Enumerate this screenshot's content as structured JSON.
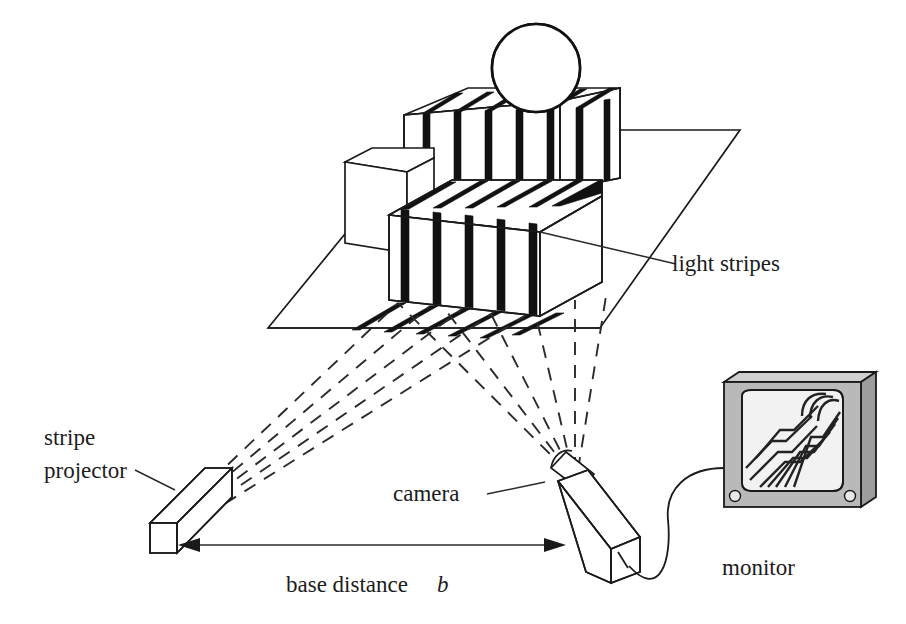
{
  "figure": {
    "background_color": "#ffffff",
    "ink_color": "#1a1a1a"
  },
  "labels": {
    "light_stripes": "light stripes",
    "stripe_projector_line1": "stripe",
    "stripe_projector_line2": "projector",
    "camera": "camera",
    "monitor": "monitor",
    "base_distance_text": "base distance",
    "base_distance_symbol": "b"
  },
  "components": {
    "projector": {
      "name": "stripe projector",
      "shape": "elongated box"
    },
    "camera": {
      "name": "camera",
      "shape": "elongated box with lens"
    },
    "monitor": {
      "name": "monitor",
      "bezel_color": "#b9b9b9",
      "screen_color": "#f2f2f2"
    },
    "scene": {
      "ground_plane": "parallelogram",
      "big_box": "striped box",
      "small_box": "plain box",
      "back_box": "striped back box",
      "sphere": "striped sphere"
    }
  },
  "geometry": {
    "stripe_count_front": 7,
    "stripe_count_ground": 7,
    "sphere_band_count": 5,
    "monitor_screen_lines": 7,
    "projector_rays": 5,
    "camera_rays": 6
  }
}
